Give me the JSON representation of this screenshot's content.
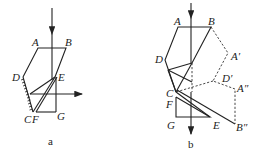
{
  "figures": [
    {
      "id": "a",
      "caption": "a",
      "labels": {
        "A": "A",
        "B": "B",
        "D": "D",
        "E": "E",
        "C": "C",
        "F": "F",
        "G": "G"
      }
    },
    {
      "id": "b",
      "caption": "b",
      "labels": {
        "A": "A",
        "B": "B",
        "D": "D",
        "C": "C",
        "F": "F",
        "G": "G",
        "E": "E",
        "A1": "A′",
        "D1": "D′",
        "A2": "A″",
        "B2": "B″"
      }
    }
  ],
  "colors": {
    "line": "#222222",
    "background": "#ffffff"
  }
}
